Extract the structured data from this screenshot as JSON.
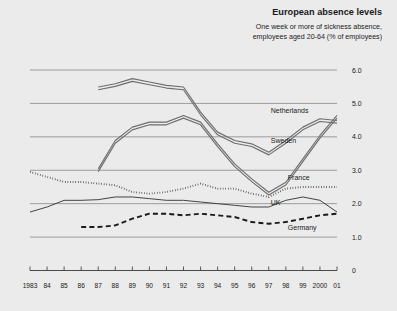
{
  "header": {
    "title": "European absence levels",
    "subtitle_line1": "One week or more of sickness absence,",
    "subtitle_line2": "employees aged 20-64 (% of employees)"
  },
  "colors": {
    "background": "#ebebeb",
    "grid": "#8e8e8e",
    "axis": "#4a4a4a",
    "text": "#1a1a1a",
    "netherlands": "#6e6e6e",
    "sweden": "#6e6e6e",
    "france": "#2b2b2b",
    "uk": "#3a3a3a",
    "germany": "#1a1a1a"
  },
  "chart_data": {
    "type": "line",
    "title": "European absence levels",
    "subtitle": "One week or more of sickness absence, employees aged 20-64 (% of employees)",
    "xlabel": "",
    "ylabel": "",
    "xlim": [
      1983,
      2001
    ],
    "ylim": [
      0,
      6.0
    ],
    "yticks": [
      0,
      1.0,
      2.0,
      3.0,
      4.0,
      5.0,
      6.0
    ],
    "ytick_labels": [
      "0",
      "1.0",
      "2.0",
      "3.0",
      "4.0",
      "5.0",
      "6.0"
    ],
    "grid": true,
    "grid_axis": "y",
    "legend_position": "inline-right-labels",
    "x": [
      1983,
      1984,
      1985,
      1986,
      1987,
      1988,
      1989,
      1990,
      1991,
      1992,
      1993,
      1994,
      1995,
      1996,
      1997,
      1998,
      1999,
      2000,
      2001
    ],
    "xtick_labels": [
      "1983",
      "84",
      "85",
      "86",
      "87",
      "88",
      "89",
      "90",
      "91",
      "92",
      "93",
      "94",
      "95",
      "96",
      "97",
      "98",
      "99",
      "2000",
      "01"
    ],
    "series": [
      {
        "name": "Netherlands",
        "style": "double-solid",
        "label_x": 1997,
        "label_y": 4.72,
        "values": [
          null,
          null,
          null,
          null,
          5.45,
          5.55,
          5.7,
          5.6,
          5.5,
          5.45,
          4.7,
          4.1,
          3.85,
          3.75,
          3.5,
          3.85,
          4.25,
          4.5,
          4.45
        ]
      },
      {
        "name": "Sweden",
        "style": "double-solid",
        "label_x": 1997,
        "label_y": 3.82,
        "values": [
          null,
          null,
          null,
          null,
          3.0,
          3.85,
          4.25,
          4.4,
          4.4,
          4.6,
          4.4,
          3.75,
          3.15,
          2.7,
          2.3,
          2.6,
          3.3,
          4.0,
          4.6
        ]
      },
      {
        "name": "France",
        "style": "dotted",
        "label_x": 1998,
        "label_y": 2.72,
        "values": [
          2.95,
          2.8,
          2.65,
          2.65,
          2.6,
          2.55,
          2.35,
          2.3,
          2.35,
          2.45,
          2.6,
          2.45,
          2.45,
          2.3,
          2.2,
          2.45,
          2.5,
          2.5,
          2.5
        ]
      },
      {
        "name": "UK",
        "style": "thin-solid",
        "label_x": 1997,
        "label_y": 1.95,
        "values": [
          1.75,
          1.9,
          2.1,
          2.1,
          2.12,
          2.2,
          2.2,
          2.15,
          2.1,
          2.1,
          2.05,
          2.0,
          1.95,
          1.9,
          1.9,
          2.1,
          2.2,
          2.1,
          1.75
        ]
      },
      {
        "name": "Germany",
        "style": "dashed",
        "label_x": 1998,
        "label_y": 1.2,
        "values": [
          null,
          null,
          null,
          1.3,
          1.3,
          1.35,
          1.55,
          1.7,
          1.7,
          1.65,
          1.7,
          1.65,
          1.6,
          1.45,
          1.4,
          1.45,
          1.55,
          1.65,
          1.7
        ]
      }
    ]
  }
}
